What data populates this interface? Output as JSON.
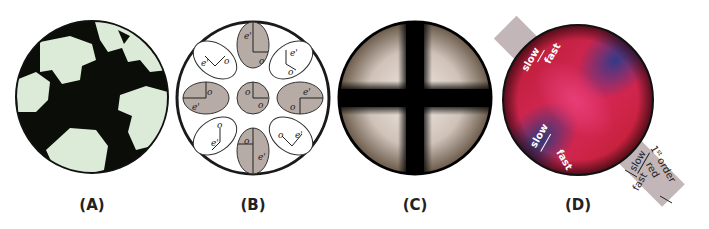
{
  "figure": {
    "panels": [
      {
        "id": "A",
        "label": "(A)",
        "description": "thin-section micrograph under crossed polars, black extinct grains and pale green-white grains"
      },
      {
        "id": "B",
        "label": "(B)",
        "description": "schematic of vibration directions in conoscopic figure",
        "ellipse_labels": {
          "extraordinary": "e'",
          "ordinary": "o"
        }
      },
      {
        "id": "C",
        "label": "(C)",
        "description": "uniaxial interference figure with black isogyre cross"
      },
      {
        "id": "D",
        "label": "(D)",
        "description": "interference figure with 1st order red accessory plate inserted",
        "annotations": {
          "upper_left": {
            "slow": "slow",
            "fast": "fast"
          },
          "lower_left": {
            "slow": "slow",
            "fast": "fast"
          },
          "plate": {
            "slow": "slow",
            "fast": "fast",
            "name_line1": "1st order",
            "name_sup": "st",
            "name_order": "order",
            "name_line2": "red",
            "num": "1"
          }
        }
      }
    ],
    "colors": {
      "gray_fill": "#b7aba5",
      "plate_gray": "#c2b6b8",
      "red": "#d8204a",
      "blue": "#2a3a8a",
      "pale_green": "#dcebd8"
    }
  }
}
